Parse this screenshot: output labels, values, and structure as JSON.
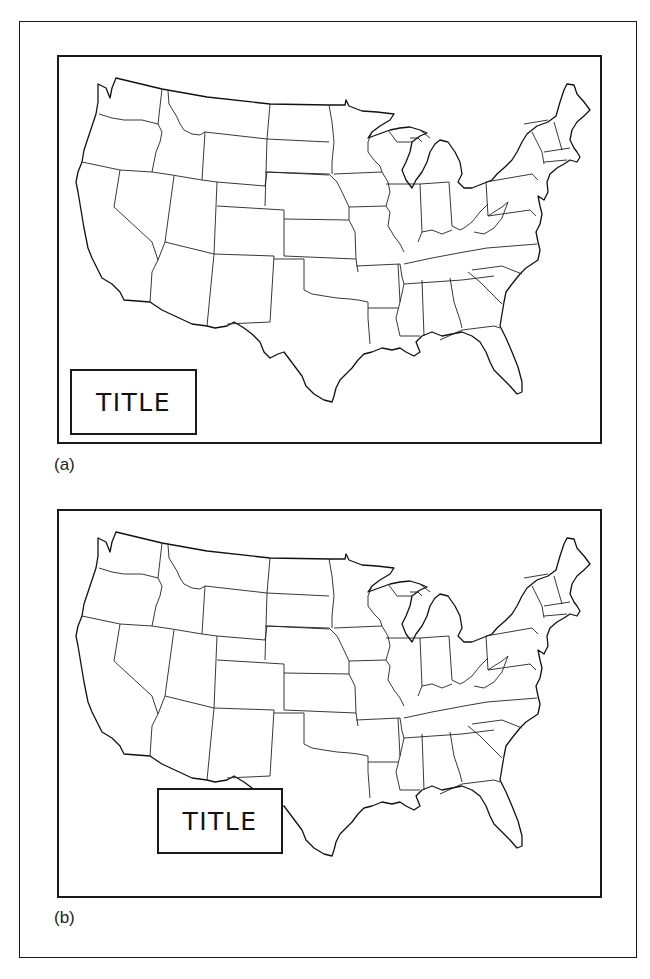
{
  "figure": {
    "panels": [
      {
        "id": "a",
        "label": "(a)",
        "title_box": {
          "text": "TITLE",
          "position": "lower-left, inside map frame, clear of landmass"
        },
        "map": "Contiguous United States with state boundaries"
      },
      {
        "id": "b",
        "label": "(b)",
        "title_box": {
          "text": "TITLE",
          "position": "lower-center, overlapping Texas border"
        },
        "map": "Contiguous United States with state boundaries"
      }
    ],
    "colors": {
      "line": "#1a1a1a",
      "background": "#ffffff"
    }
  }
}
